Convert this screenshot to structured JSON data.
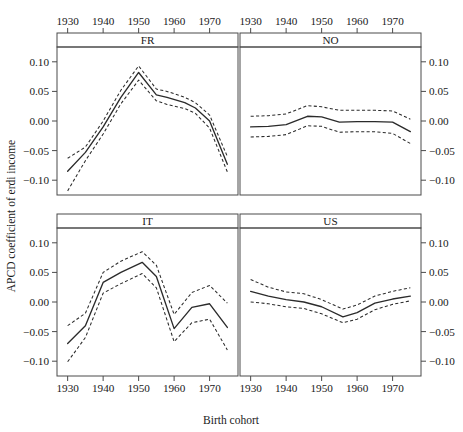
{
  "chart_data": {
    "type": "line",
    "title": "",
    "xlabel": "Birth cohort",
    "ylabel": "APCD coefficient of erdi income",
    "xlim": [
      1927,
      1978
    ],
    "ylim": [
      -0.125,
      0.125
    ],
    "xticks": [
      1930,
      1940,
      1950,
      1960,
      1970
    ],
    "xtick_labels": [
      "1930",
      "1940",
      "1950",
      "1960",
      "1970"
    ],
    "yticks": [
      0.1,
      0.05,
      0.0,
      -0.05,
      -0.1
    ],
    "ytick_labels": [
      "0.10",
      "0.05",
      "0.00",
      "−0.05",
      "−0.10"
    ],
    "grid": false,
    "legend": "none",
    "layout": "2x2 trellis panels, x-axis on top for upper row and bottom for lower row, y-axis on left for left column and right for right column",
    "series_style": {
      "estimate": "solid line",
      "confidence_band": "dashed lines (upper and lower)"
    },
    "panels": [
      {
        "label": "FR",
        "position": "top-left",
        "x": [
          1930,
          1935,
          1940,
          1945,
          1950,
          1955,
          1958,
          1963,
          1966,
          1970,
          1975
        ],
        "estimate": [
          -0.085,
          -0.053,
          -0.01,
          0.04,
          0.082,
          0.044,
          0.04,
          0.031,
          0.022,
          0.0,
          -0.073
        ],
        "ci_upper": [
          -0.063,
          -0.044,
          0.0,
          0.052,
          0.093,
          0.054,
          0.05,
          0.04,
          0.031,
          0.01,
          -0.06
        ],
        "ci_lower": [
          -0.118,
          -0.067,
          -0.022,
          0.029,
          0.069,
          0.034,
          0.028,
          0.021,
          0.013,
          -0.012,
          -0.086
        ]
      },
      {
        "label": "NO",
        "position": "top-right",
        "x": [
          1930,
          1935,
          1940,
          1946,
          1950,
          1955,
          1960,
          1965,
          1970,
          1975
        ],
        "estimate": [
          -0.01,
          -0.009,
          -0.006,
          0.008,
          0.007,
          -0.002,
          -0.001,
          -0.001,
          -0.002,
          -0.018
        ],
        "ci_upper": [
          0.008,
          0.009,
          0.012,
          0.026,
          0.024,
          0.018,
          0.018,
          0.018,
          0.017,
          0.003
        ],
        "ci_lower": [
          -0.027,
          -0.026,
          -0.023,
          -0.008,
          -0.009,
          -0.019,
          -0.018,
          -0.018,
          -0.021,
          -0.038
        ]
      },
      {
        "label": "IT",
        "position": "bottom-left",
        "x": [
          1930,
          1935,
          1940,
          1945,
          1951,
          1955,
          1960,
          1965,
          1970,
          1975
        ],
        "estimate": [
          -0.07,
          -0.04,
          0.033,
          0.05,
          0.067,
          0.043,
          -0.045,
          -0.009,
          -0.003,
          -0.043
        ],
        "ci_upper": [
          -0.04,
          -0.019,
          0.05,
          0.069,
          0.085,
          0.062,
          -0.021,
          0.016,
          0.028,
          -0.002
        ],
        "ci_lower": [
          -0.101,
          -0.06,
          0.015,
          0.031,
          0.048,
          0.024,
          -0.067,
          -0.035,
          -0.029,
          -0.081
        ]
      },
      {
        "label": "US",
        "position": "bottom-right",
        "x": [
          1930,
          1935,
          1940,
          1945,
          1950,
          1956,
          1960,
          1965,
          1970,
          1975
        ],
        "estimate": [
          0.018,
          0.01,
          0.004,
          0.0,
          -0.008,
          -0.025,
          -0.018,
          -0.002,
          0.005,
          0.01
        ],
        "ci_upper": [
          0.038,
          0.025,
          0.017,
          0.014,
          0.004,
          -0.012,
          -0.005,
          0.01,
          0.018,
          0.024
        ],
        "ci_lower": [
          0.0,
          -0.003,
          -0.008,
          -0.011,
          -0.02,
          -0.035,
          -0.029,
          -0.013,
          -0.004,
          0.002
        ]
      }
    ]
  }
}
